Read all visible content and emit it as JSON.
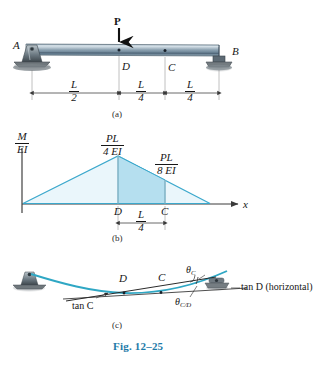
{
  "figure": {
    "caption": "Fig. 12–25",
    "caption_color": "#1d7aa8",
    "accent_color": "#3ba8cc",
    "fill_color": "#b5dfef",
    "beam_color": "#7a91a3"
  },
  "panel_a": {
    "tag": "(a)",
    "load_label": "P",
    "support_left_label": "A",
    "support_right_label": "B",
    "point_d_label": "D",
    "point_c_label": "C",
    "dimensions": [
      {
        "num": "L",
        "den": "2"
      },
      {
        "num": "L",
        "den": "4"
      },
      {
        "num": "L",
        "den": "4"
      }
    ]
  },
  "panel_b": {
    "tag": "(b)",
    "y_axis": {
      "num": "M",
      "den": "EI"
    },
    "x_axis_label": "x",
    "peak_value": {
      "num": "PL",
      "den": "4 EI"
    },
    "mid_value": {
      "num": "PL",
      "den": "8 EI"
    },
    "point_d_label": "D",
    "point_c_label": "C",
    "segment_dimension": {
      "num": "L",
      "den": "4"
    }
  },
  "panel_c": {
    "tag": "(c)",
    "point_d_label": "D",
    "point_c_label": "C",
    "theta_c": "θ",
    "theta_c_sub": "C",
    "theta_cd": "θ",
    "theta_cd_sub": "C/D",
    "tan_c_label": "tan C",
    "tan_d_label": "tan D (horizontal)"
  }
}
